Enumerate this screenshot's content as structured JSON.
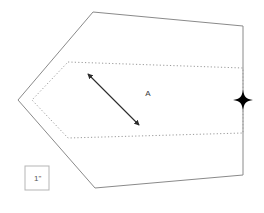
{
  "figure": {
    "title": "",
    "background_color": "#ffffff",
    "outline_color": "#8a8a8a",
    "dotted_color": "#9a9a9a",
    "arrow_color": "#2b2b2b",
    "marker_color": "#000000",
    "scale_box_color": "#b5b5b5",
    "region_label": "A",
    "scale_label": "1\"",
    "marker_name": "four-pointed-star",
    "outer_polygon_points": "93,12 243,26 243,175 95,188 18,100",
    "inner_dotted_polygon_points": "68,62 243,68 243,133 68,138 32,100",
    "arrow": {
      "x1": 139,
      "y1": 125,
      "x2": 88,
      "y2": 74,
      "double_headed": true
    },
    "region_label_position": {
      "x": 148,
      "y": 96
    },
    "marker_position": {
      "x": 243,
      "y": 100
    },
    "scale_box": {
      "x": 25,
      "y": 166,
      "width": 24,
      "height": 24
    }
  }
}
